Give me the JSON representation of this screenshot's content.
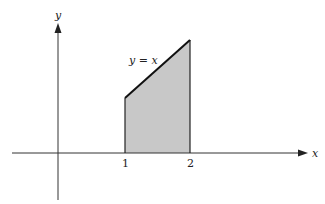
{
  "diagram": {
    "axes": {
      "x_label": "x",
      "y_label": "y"
    },
    "curve_label": "y = x",
    "ticks": [
      {
        "label": "1",
        "value": 1
      },
      {
        "label": "2",
        "value": 2
      }
    ],
    "region": {
      "from": 1,
      "to": 2,
      "fill": "#c8c8c8",
      "description": "shaded area under y = x between x = 1 and x = 2"
    },
    "colors": {
      "axis": "#333333",
      "curve": "#111111",
      "fill": "#c8c8c8"
    }
  }
}
